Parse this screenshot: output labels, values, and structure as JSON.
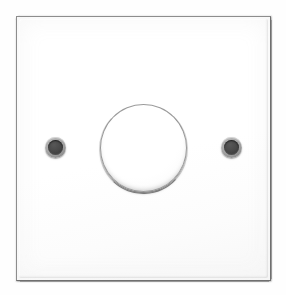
{
  "scene": {
    "subject": "rotary dimmer light switch faceplate",
    "view": "front elevation",
    "background_color": "#fefefe",
    "canvas": {
      "width": 286,
      "height": 295
    }
  },
  "faceplate": {
    "label": "Dimmer switch faceplate",
    "shape": "square",
    "finish": "white gloss",
    "face_color": "#ffffff",
    "outline_color": "#8d8d8d",
    "shadow_color": "#6f6f6f",
    "bounds": {
      "left": 16,
      "top": 16,
      "width": 255,
      "height": 265
    }
  },
  "knob": {
    "label": "Rotary dimmer knob",
    "shape": "circle",
    "face_color": "#ffffff",
    "outline_color": "#9a9a9a",
    "shadow_color": "#5a5a5a",
    "center": {
      "x": 143,
      "y": 148
    },
    "diameter": 88
  },
  "screws": [
    {
      "label": "Left fixing screw",
      "position": "left",
      "ring_color": "#9f9f9f",
      "head_color": "#3d3d3d",
      "center": {
        "x": 55,
        "y": 147
      },
      "diameter": 21
    },
    {
      "label": "Right fixing screw",
      "position": "right",
      "ring_color": "#9f9f9f",
      "head_color": "#3d3d3d",
      "center": {
        "x": 231,
        "y": 147
      },
      "diameter": 21
    }
  ]
}
